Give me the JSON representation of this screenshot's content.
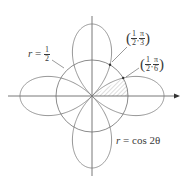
{
  "figure": {
    "curves": [
      {
        "name": "four-leaved rose",
        "equation_lhs": "r",
        "equation_rhs": "cos 2θ",
        "label": "r = cos 2θ"
      },
      {
        "name": "circle",
        "equation_lhs": "r",
        "equation_rhs_num": "1",
        "equation_rhs_den": "2",
        "label": "r = 1/2"
      }
    ],
    "points": [
      {
        "r_num": "1",
        "r_den": "2",
        "theta_num": "π",
        "theta_den": "3",
        "label": "(1/2, π/3)"
      },
      {
        "r_num": "1",
        "r_den": "2",
        "theta_num": "π",
        "theta_den": "6",
        "label": "(1/2, π/6)"
      }
    ],
    "shaded_region": "between θ = 0 and θ = π/6 inside r = 1/2",
    "colors": {
      "curve": "#7a7a7a",
      "axis": "#555555",
      "shade": "#c8c8c8",
      "text": "#3a3a3a"
    }
  }
}
